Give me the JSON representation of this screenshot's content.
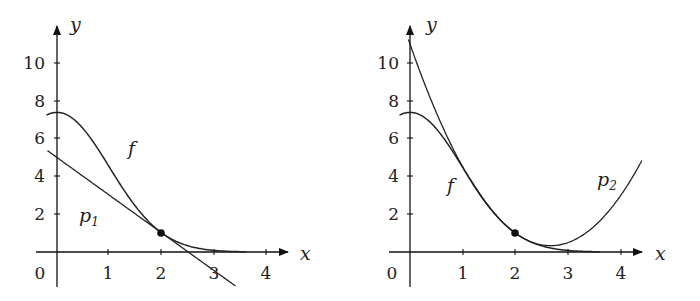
{
  "chart_data": [
    {
      "type": "line",
      "title": "",
      "xlabel": "x",
      "ylabel": "y",
      "xlim": [
        -0.2,
        4.4
      ],
      "ylim": [
        -1.5,
        11.5
      ],
      "xticks": [
        "0",
        "1",
        "2",
        "3",
        "4"
      ],
      "yticks": [
        "2",
        "4",
        "6",
        "8",
        "10"
      ],
      "grid": false,
      "series": [
        {
          "name": "f",
          "formula": "e^(2 - x^2/2)",
          "x": [
            0,
            0.5,
            1,
            1.5,
            2,
            2.5,
            3,
            3.5
          ],
          "values": [
            7.39,
            6.52,
            4.48,
            2.4,
            1.0,
            0.32,
            0.08,
            0.01
          ]
        },
        {
          "name": "p1",
          "formula": "5 - 2x",
          "x": [
            -0.2,
            0,
            1,
            2,
            2.5,
            3,
            3.4
          ],
          "values": [
            5.4,
            5,
            3,
            1,
            0,
            -1,
            -1.8
          ]
        }
      ],
      "annotations": [
        {
          "label": "f",
          "x": 1.5,
          "y": 5.5
        },
        {
          "label": "p1",
          "x": 0.5,
          "y": 1.5
        },
        {
          "label": "point",
          "x": 2,
          "y": 1
        }
      ]
    },
    {
      "type": "line",
      "title": "",
      "xlabel": "x",
      "ylabel": "y",
      "xlim": [
        -0.2,
        4.4
      ],
      "ylim": [
        -1.5,
        11.5
      ],
      "xticks": [
        "0",
        "1",
        "2",
        "3",
        "4"
      ],
      "yticks": [
        "2",
        "4",
        "6",
        "8",
        "10"
      ],
      "grid": false,
      "series": [
        {
          "name": "f",
          "formula": "e^(2 - x^2/2)",
          "x": [
            0,
            0.5,
            1,
            1.5,
            2,
            2.5,
            3,
            3.5
          ],
          "values": [
            7.39,
            6.52,
            4.48,
            2.4,
            1.0,
            0.32,
            0.08,
            0.01
          ]
        },
        {
          "name": "p2",
          "formula": "1 - 2(x-2) + 1.5(x-2)^2",
          "x": [
            0,
            1,
            2,
            2.67,
            3,
            4,
            4.4
          ],
          "values": [
            11,
            4.5,
            1,
            0.33,
            0.5,
            3,
            4.84
          ]
        }
      ],
      "annotations": [
        {
          "label": "f",
          "x": 0.75,
          "y": 3.2
        },
        {
          "label": "p2",
          "x": 3.7,
          "y": 3.5
        },
        {
          "label": "point",
          "x": 2,
          "y": 1
        }
      ]
    }
  ],
  "labels": {
    "x": "x",
    "y": "y",
    "origin": "0",
    "xticks": [
      "1",
      "2",
      "3",
      "4"
    ],
    "yticks": [
      "2",
      "4",
      "6",
      "8",
      "10"
    ],
    "f": "f",
    "p": "p",
    "p1_sub": "1",
    "p2_sub": "2"
  }
}
